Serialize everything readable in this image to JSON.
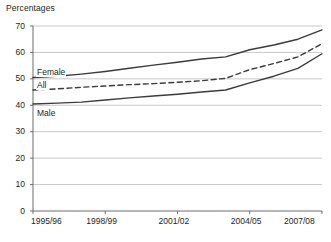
{
  "chart_data": {
    "type": "line",
    "title": "Percentages",
    "xlabel": "",
    "ylabel": "",
    "ylim": [
      0,
      70
    ],
    "ytick_step": 10,
    "yticks": [
      "0",
      "10",
      "20",
      "30",
      "40",
      "50",
      "60",
      "70"
    ],
    "grid": true,
    "grid_axis": "y",
    "legend_position": "inline-labels",
    "x": [
      "1995/96",
      "1996/97",
      "1997/98",
      "1998/99",
      "1999/00",
      "2000/01",
      "2001/02",
      "2002/03",
      "2003/04",
      "2004/05",
      "2005/06",
      "2006/07",
      "2007/08"
    ],
    "xtick_labels": [
      "1995/96",
      "1998/99",
      "2001/02",
      "2004/05",
      "2007/08"
    ],
    "xtick_index": [
      0,
      3,
      6,
      9,
      12
    ],
    "series": [
      {
        "name": "Female",
        "style": "solid",
        "color": "#3b3b3b",
        "values": [
          50.5,
          51.0,
          51.8,
          52.8,
          54.0,
          55.2,
          56.3,
          57.5,
          58.3,
          61.0,
          62.8,
          65.0,
          68.5
        ]
      },
      {
        "name": "All",
        "style": "dashed",
        "color": "#3b3b3b",
        "values": [
          45.8,
          46.2,
          46.8,
          47.3,
          47.8,
          48.2,
          48.7,
          49.3,
          50.2,
          53.5,
          55.8,
          58.3,
          63.3
        ]
      },
      {
        "name": "Male",
        "style": "solid",
        "color": "#3b3b3b",
        "values": [
          40.5,
          40.8,
          41.2,
          42.0,
          42.8,
          43.5,
          44.2,
          45.0,
          45.8,
          48.5,
          51.0,
          54.0,
          59.5
        ]
      }
    ],
    "annotations": [
      {
        "text": "Female",
        "series": "Female"
      },
      {
        "text": "All",
        "series": "All"
      },
      {
        "text": "Male",
        "series": "Male"
      }
    ]
  },
  "colors": {
    "line": "#3b3b3b",
    "grid": "#c9c9c9",
    "axis": "#6d6d6d",
    "text": "#231f20",
    "background": "#ffffff"
  }
}
